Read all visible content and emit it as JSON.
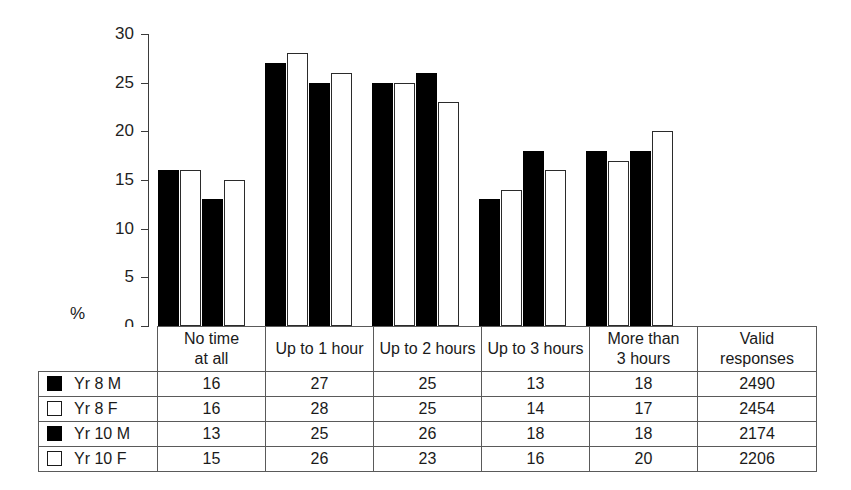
{
  "chart_data": {
    "type": "bar",
    "title": "",
    "xlabel": "",
    "ylabel": "%",
    "ylim": [
      0,
      30
    ],
    "yticks": [
      0,
      5,
      10,
      15,
      20,
      25,
      30
    ],
    "grid": false,
    "legend_position": "table-left-column",
    "categories": [
      "No time at all",
      "Up to 1 hour",
      "Up to 2 hours",
      "Up to 3 hours",
      "More than 3 hours"
    ],
    "series": [
      {
        "name": "Yr 8 M",
        "style": "filled",
        "values": [
          16,
          27,
          25,
          13,
          18
        ],
        "valid_responses": 2490
      },
      {
        "name": "Yr 8 F",
        "style": "open",
        "values": [
          16,
          28,
          25,
          14,
          17
        ],
        "valid_responses": 2454
      },
      {
        "name": "Yr 10 M",
        "style": "filled",
        "values": [
          13,
          25,
          26,
          18,
          18
        ],
        "valid_responses": 2174
      },
      {
        "name": "Yr 10 F",
        "style": "open",
        "values": [
          15,
          26,
          23,
          16,
          20
        ],
        "valid_responses": 2206
      }
    ]
  },
  "axis": {
    "unit_label": "%",
    "tick_labels": [
      "30",
      "25",
      "20",
      "15",
      "10",
      "5",
      "0"
    ]
  },
  "table": {
    "legend_header": "",
    "column_headers": [
      {
        "line1": "No time",
        "line2": "at all"
      },
      {
        "line1": "Up to 1 hour",
        "line2": ""
      },
      {
        "line1": "Up to 2 hours",
        "line2": ""
      },
      {
        "line1": "Up to 3 hours",
        "line2": ""
      },
      {
        "line1": "More than",
        "line2": "3 hours"
      },
      {
        "line1": "Valid",
        "line2": "responses"
      }
    ],
    "rows": [
      {
        "swatch": "filled",
        "label": "Yr 8 M",
        "cells": [
          "16",
          "27",
          "25",
          "13",
          "18",
          "2490"
        ]
      },
      {
        "swatch": "open",
        "label": "Yr 8 F",
        "cells": [
          "16",
          "28",
          "25",
          "14",
          "17",
          "2454"
        ]
      },
      {
        "swatch": "filled",
        "label": "Yr 10 M",
        "cells": [
          "13",
          "25",
          "26",
          "18",
          "18",
          "2174"
        ]
      },
      {
        "swatch": "open",
        "label": "Yr 10 F",
        "cells": [
          "15",
          "26",
          "23",
          "16",
          "20",
          "2206"
        ]
      }
    ]
  },
  "colors": {
    "filled_bar": "#000000",
    "open_bar_border": "#2b2b2b",
    "axis": "#3b3b3b",
    "table_border": "#5a5a5a",
    "background": "#ffffff"
  }
}
